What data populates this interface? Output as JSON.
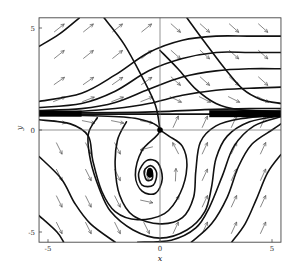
{
  "chart_data": {
    "type": "scatter",
    "subtype": "phase-portrait",
    "title": "",
    "xlabel": "x",
    "ylabel": "y",
    "xlim": [
      -5.4,
      5.4
    ],
    "ylim": [
      -5.5,
      5.5
    ],
    "x_ticks": [
      {
        "value": -5,
        "label": "-5"
      },
      {
        "value": 0,
        "label": "0"
      },
      {
        "value": 5,
        "label": "5"
      }
    ],
    "y_ticks": [
      {
        "value": -5,
        "label": "-5"
      },
      {
        "value": 0,
        "label": "0"
      },
      {
        "value": 5,
        "label": "5"
      }
    ],
    "grid": false,
    "zero_axes": true,
    "fixed_points": [
      {
        "name": "saddle",
        "x": 0,
        "y": 0
      },
      {
        "name": "spiral-sink",
        "x": -0.45,
        "y": -2.1
      }
    ],
    "attracting_line_y": 0.8,
    "direction_field": {
      "x_values": [
        -4.5,
        -3.2,
        -1.9,
        -0.6,
        0.7,
        2.0,
        3.3,
        4.6
      ],
      "y_values": [
        5.0,
        3.7,
        2.4,
        1.5,
        0.4,
        -0.9,
        -2.2,
        -3.5,
        -4.8
      ]
    },
    "trajectories": [
      {
        "points": [
          [
            -5.4,
            4.1
          ],
          [
            -4.5,
            4.7
          ],
          [
            -3.6,
            5.5
          ]
        ]
      },
      {
        "points": [
          [
            -5.4,
            1.4
          ],
          [
            -3.5,
            1.8
          ],
          [
            -2,
            2.7
          ],
          [
            -0.5,
            3.8
          ],
          [
            1,
            4.4
          ],
          [
            2.5,
            4.6
          ],
          [
            4,
            4.6
          ],
          [
            5.4,
            4.6
          ]
        ]
      },
      {
        "points": [
          [
            -5.4,
            1.1
          ],
          [
            -3.5,
            1.3
          ],
          [
            -2,
            1.9
          ],
          [
            -0.5,
            2.9
          ],
          [
            1,
            3.5
          ],
          [
            2.5,
            3.8
          ],
          [
            4,
            3.8
          ],
          [
            5.4,
            3.8
          ]
        ]
      },
      {
        "points": [
          [
            -5.4,
            0.95
          ],
          [
            -3.5,
            1.05
          ],
          [
            -2,
            1.35
          ],
          [
            -0.5,
            2.0
          ],
          [
            1,
            2.6
          ],
          [
            2.5,
            2.9
          ],
          [
            4,
            3.0
          ],
          [
            5.4,
            3.0
          ]
        ]
      },
      {
        "points": [
          [
            -5.4,
            0.88
          ],
          [
            -3.5,
            0.92
          ],
          [
            -2,
            1.05
          ],
          [
            -0.5,
            1.3
          ],
          [
            1,
            1.7
          ],
          [
            2.5,
            1.95
          ],
          [
            4,
            2.05
          ],
          [
            5.4,
            2.1
          ]
        ]
      },
      {
        "points": [
          [
            -5.4,
            0.83
          ],
          [
            -2,
            0.85
          ],
          [
            0,
            0.9
          ],
          [
            2,
            1.0
          ],
          [
            4,
            1.05
          ],
          [
            5.4,
            1.05
          ]
        ]
      },
      {
        "points": [
          [
            -5.4,
            0.78
          ],
          [
            5.4,
            0.78
          ]
        ]
      },
      {
        "points": [
          [
            -5.4,
            0.72
          ],
          [
            -3,
            0.7
          ],
          [
            -1,
            0.55
          ],
          [
            0,
            0
          ],
          [
            -0.8,
            -1.0
          ],
          [
            -1.1,
            -2.2
          ],
          [
            -0.8,
            -3.0
          ],
          [
            -0.2,
            -3.1
          ],
          [
            0.1,
            -2.4
          ],
          [
            -0.1,
            -1.6
          ],
          [
            -0.6,
            -1.5
          ],
          [
            -0.95,
            -2.1
          ],
          [
            -0.8,
            -2.7
          ],
          [
            -0.3,
            -2.7
          ],
          [
            -0.15,
            -2.1
          ],
          [
            -0.4,
            -1.75
          ],
          [
            -0.7,
            -2.0
          ],
          [
            -0.6,
            -2.45
          ],
          [
            -0.35,
            -2.4
          ],
          [
            -0.35,
            -2.05
          ],
          [
            -0.5,
            -1.95
          ],
          [
            -0.55,
            -2.2
          ],
          [
            -0.45,
            -2.25
          ]
        ]
      },
      {
        "points": [
          [
            -5.4,
            0.5
          ],
          [
            -4,
            0.3
          ],
          [
            -3.2,
            -0.3
          ],
          [
            -3.0,
            -1.5
          ],
          [
            -2.6,
            -3.0
          ],
          [
            -2.0,
            -4.0
          ],
          [
            -1.0,
            -4.4
          ],
          [
            0.2,
            -4.1
          ],
          [
            0.9,
            -3.1
          ],
          [
            1.2,
            -1.8
          ],
          [
            1.0,
            -0.8
          ],
          [
            0.4,
            -0.3
          ],
          [
            0,
            0
          ]
        ]
      },
      {
        "points": [
          [
            -2.5,
            5.5
          ],
          [
            -1.6,
            4.2
          ],
          [
            -0.8,
            2.6
          ],
          [
            -0.2,
            1.2
          ],
          [
            0,
            0
          ]
        ]
      },
      {
        "points": [
          [
            -5.4,
            -1.3
          ],
          [
            -4.4,
            -2.4
          ],
          [
            -3.8,
            -3.6
          ],
          [
            -3.1,
            -4.6
          ],
          [
            -2.0,
            -5.5
          ]
        ]
      },
      {
        "points": [
          [
            -5.4,
            -4.2
          ],
          [
            -4.6,
            -5.0
          ],
          [
            -4.3,
            -5.5
          ]
        ]
      },
      {
        "points": [
          [
            -1.5,
            0.4
          ],
          [
            -1.9,
            -0.5
          ],
          [
            -2.0,
            -1.8
          ],
          [
            -1.8,
            -3.2
          ],
          [
            -1.2,
            -4.2
          ],
          [
            0,
            -4.6
          ],
          [
            1.0,
            -4.3
          ],
          [
            1.5,
            -3.3
          ],
          [
            1.6,
            -2.0
          ],
          [
            1.8,
            -0.6
          ],
          [
            2.5,
            0.2
          ],
          [
            3.6,
            0.55
          ],
          [
            5.4,
            0.75
          ]
        ]
      },
      {
        "points": [
          [
            -2.8,
            0.6
          ],
          [
            -3.2,
            -0.2
          ],
          [
            -3.1,
            -1.5
          ],
          [
            -2.7,
            -2.9
          ],
          [
            -2.2,
            -4.0
          ],
          [
            -1.2,
            -4.9
          ],
          [
            0,
            -5.3
          ],
          [
            1.2,
            -4.9
          ],
          [
            2.0,
            -4.0
          ],
          [
            2.3,
            -2.8
          ],
          [
            2.5,
            -1.4
          ],
          [
            3.0,
            -0.3
          ],
          [
            4.0,
            0.4
          ],
          [
            5.4,
            0.7
          ]
        ]
      },
      {
        "points": [
          [
            -1.0,
            -5.5
          ],
          [
            0.5,
            -5.4
          ],
          [
            1.6,
            -4.8
          ],
          [
            2.2,
            -3.8
          ],
          [
            2.8,
            -2.2
          ],
          [
            3.3,
            -0.8
          ],
          [
            4.2,
            0.2
          ],
          [
            5.4,
            0.65
          ]
        ]
      },
      {
        "points": [
          [
            1.4,
            -5.5
          ],
          [
            2.3,
            -4.6
          ],
          [
            3.0,
            -3.3
          ],
          [
            3.5,
            -1.8
          ],
          [
            4.1,
            -0.7
          ],
          [
            5.0,
            0.0
          ],
          [
            5.4,
            0.3
          ]
        ]
      },
      {
        "points": [
          [
            3.2,
            -5.5
          ],
          [
            3.8,
            -4.6
          ],
          [
            4.3,
            -3.4
          ],
          [
            4.8,
            -2.1
          ],
          [
            5.4,
            -1.2
          ]
        ]
      },
      {
        "points": [
          [
            1.2,
            5.5
          ],
          [
            2.0,
            4.3
          ],
          [
            2.9,
            3.0
          ],
          [
            3.7,
            2.0
          ],
          [
            4.5,
            1.5
          ],
          [
            5.4,
            1.3
          ]
        ]
      },
      {
        "points": [
          [
            0.0,
            3.9
          ],
          [
            0.8,
            3.0
          ],
          [
            1.6,
            2.0
          ],
          [
            2.5,
            1.3
          ],
          [
            3.5,
            1.0
          ],
          [
            5.4,
            0.9
          ]
        ]
      }
    ]
  }
}
